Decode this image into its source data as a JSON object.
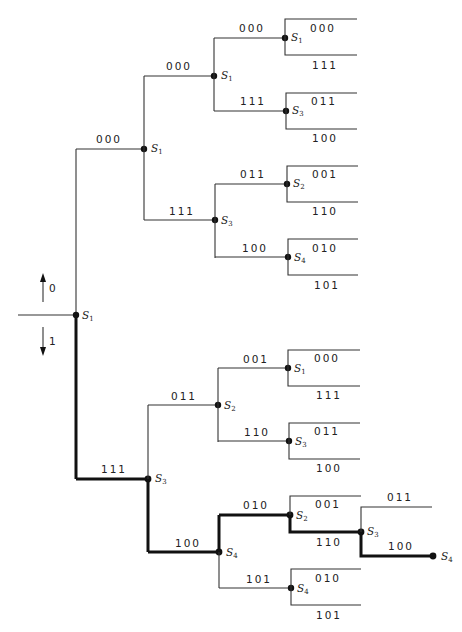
{
  "legend": {
    "up_input": "0",
    "down_input": "1"
  },
  "colors": {
    "line": "#333333",
    "path": "#111111",
    "background": "#ffffff"
  },
  "root": {
    "state": "S",
    "sub": "1"
  },
  "tree": {
    "upper": {
      "edge": "000",
      "state": "S",
      "sub": "1",
      "upper": {
        "edge": "000",
        "state": "S",
        "sub": "1",
        "upper": {
          "edge": "000",
          "state": "S",
          "sub": "1",
          "out_up": "000",
          "out_down": "111"
        },
        "lower": {
          "edge": "111",
          "state": "S",
          "sub": "3",
          "out_up": "011",
          "out_down": "100"
        }
      },
      "lower": {
        "edge": "111",
        "state": "S",
        "sub": "3",
        "upper": {
          "edge": "011",
          "state": "S",
          "sub": "2",
          "out_up": "001",
          "out_down": "110"
        },
        "lower": {
          "edge": "100",
          "state": "S",
          "sub": "4",
          "out_up": "010",
          "out_down": "101"
        }
      }
    },
    "lower": {
      "edge": "111",
      "state": "S",
      "sub": "3",
      "upper": {
        "edge": "011",
        "state": "S",
        "sub": "2",
        "upper": {
          "edge": "001",
          "state": "S",
          "sub": "1",
          "out_up": "000",
          "out_down": "111"
        },
        "lower": {
          "edge": "110",
          "state": "S",
          "sub": "3",
          "out_up": "011",
          "out_down": "100"
        }
      },
      "lower": {
        "edge": "100",
        "state": "S",
        "sub": "4",
        "upper": {
          "edge": "010",
          "state": "S",
          "sub": "2",
          "out_up": "001",
          "out_down": "110",
          "next": {
            "state": "S",
            "sub": "3",
            "out_up": "011",
            "out_down": "100",
            "end": {
              "state": "S",
              "sub": "4"
            }
          }
        },
        "lower": {
          "edge": "101",
          "state": "S",
          "sub": "4",
          "out_up": "010",
          "out_down": "101"
        }
      }
    }
  },
  "highlighted_path": [
    "111",
    "100",
    "010",
    "110",
    "100"
  ]
}
